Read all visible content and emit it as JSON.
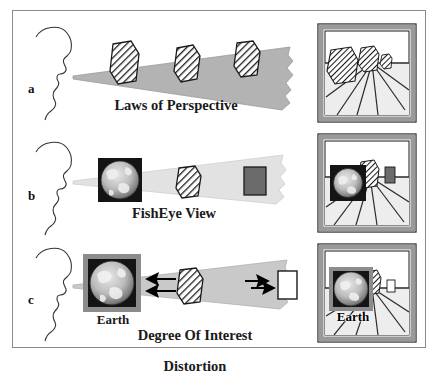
{
  "figure": {
    "background_color": "#ffffff",
    "border_color": "#8a8a8a"
  },
  "palette": {
    "cone_perspective": "#b3b3b3",
    "cone_fisheye": "#e2e2e2",
    "cone_doi": "#c9c9c9",
    "hatch_stroke": "#1a1a1a",
    "building_fill": "#ffffff",
    "dark_block": "#6b6b6b",
    "white_block": "#ffffff",
    "frame_border": "#9a9a9a",
    "frame_outline": "#1a1a1a",
    "earth_bg": "#141414",
    "earth_surface": "#b9b9b9",
    "earth_border": "#8c8c8c",
    "arrow": "#000000",
    "line": "#2a2a2a",
    "text": "#1a1a1a"
  },
  "panels": [
    {
      "id": "a",
      "letter": "a",
      "caption": "Laws of Perspective",
      "caption_lines": [
        "Laws of Perspective"
      ],
      "cone_label": "perspective-cone",
      "objects": [
        {
          "name": "building-near",
          "type": "hatched-hexagon",
          "size": "large"
        },
        {
          "name": "building-mid",
          "type": "hatched-hexagon",
          "size": "medium"
        },
        {
          "name": "building-far",
          "type": "hatched-hexagon",
          "size": "small"
        }
      ],
      "thumbnail": {
        "name": "street-scene-perspective",
        "has_earth": false,
        "earth_label": "",
        "buildings": 3
      }
    },
    {
      "id": "b",
      "letter": "b",
      "caption": "FishEye View",
      "caption_lines": [
        "FishEye View"
      ],
      "cone_label": "fisheye-cone",
      "objects": [
        {
          "name": "earth-image",
          "type": "earth-globe",
          "size": "large"
        },
        {
          "name": "building-mid",
          "type": "hatched-hexagon",
          "size": "medium"
        },
        {
          "name": "building-far",
          "type": "dark-rectangle",
          "size": "small"
        }
      ],
      "thumbnail": {
        "name": "street-scene-fisheye",
        "has_earth": true,
        "earth_label": "",
        "buildings": 2
      }
    },
    {
      "id": "c",
      "letter": "c",
      "caption": "Degree Of Interest Distortion",
      "caption_lines": [
        "Degree Of Interest",
        "Distortion"
      ],
      "cone_label": "doi-cone",
      "earth_caption": "Earth",
      "objects": [
        {
          "name": "earth-image",
          "type": "earth-globe-bordered",
          "size": "large"
        },
        {
          "name": "building-mid",
          "type": "hatched-hexagon",
          "size": "medium"
        },
        {
          "name": "block-far",
          "type": "white-rectangle",
          "size": "small"
        }
      ],
      "arrows": [
        {
          "name": "arrow-left-pair",
          "direction": "left",
          "count": 2
        },
        {
          "name": "arrow-right-pair",
          "direction": "right",
          "count": 2
        }
      ],
      "thumbnail": {
        "name": "street-scene-doi",
        "has_earth": true,
        "earth_label": "Earth",
        "buildings": 2
      }
    }
  ]
}
